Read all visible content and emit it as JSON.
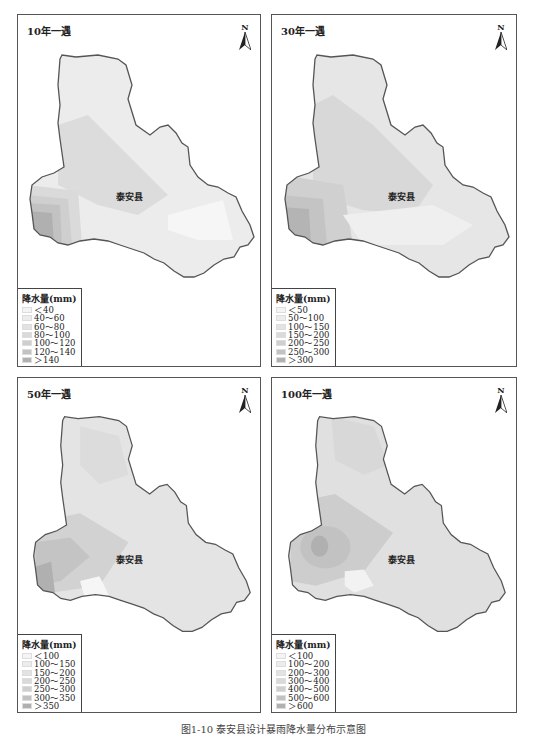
{
  "figure": {
    "caption": "图1-10 泰安县设计暴雨降水量分布示意图"
  },
  "shared": {
    "county_label": "泰安县",
    "north_label": "N",
    "legend_title": "降水量(mm)"
  },
  "panels": [
    {
      "title": "10年一遇",
      "legend": [
        {
          "label": "＜40",
          "color": "#f4f4f4"
        },
        {
          "label": "40～60",
          "color": "#ececec"
        },
        {
          "label": "60～80",
          "color": "#e3e3e3"
        },
        {
          "label": "80～100",
          "color": "#dadada"
        },
        {
          "label": "100～120",
          "color": "#cfcfcf"
        },
        {
          "label": "120～140",
          "color": "#c2c2c2"
        },
        {
          "label": "＞140",
          "color": "#b0b0b0"
        }
      ]
    },
    {
      "title": "30年一遇",
      "legend": [
        {
          "label": "＜50",
          "color": "#f4f4f4"
        },
        {
          "label": "50～100",
          "color": "#ececec"
        },
        {
          "label": "100～150",
          "color": "#e3e3e3"
        },
        {
          "label": "150～200",
          "color": "#dadada"
        },
        {
          "label": "200～250",
          "color": "#cfcfcf"
        },
        {
          "label": "250～300",
          "color": "#c2c2c2"
        },
        {
          "label": "＞300",
          "color": "#b0b0b0"
        }
      ]
    },
    {
      "title": "50年一遇",
      "legend": [
        {
          "label": "＜100",
          "color": "#f4f4f4"
        },
        {
          "label": "100～150",
          "color": "#ececec"
        },
        {
          "label": "150～200",
          "color": "#e3e3e3"
        },
        {
          "label": "200～250",
          "color": "#dadada"
        },
        {
          "label": "250～300",
          "color": "#cfcfcf"
        },
        {
          "label": "300～350",
          "color": "#c2c2c2"
        },
        {
          "label": "＞350",
          "color": "#b0b0b0"
        }
      ]
    },
    {
      "title": "100年一遇",
      "legend": [
        {
          "label": "＜100",
          "color": "#f4f4f4"
        },
        {
          "label": "100～200",
          "color": "#ececec"
        },
        {
          "label": "200～300",
          "color": "#e3e3e3"
        },
        {
          "label": "300～400",
          "color": "#dadada"
        },
        {
          "label": "400～500",
          "color": "#cfcfcf"
        },
        {
          "label": "500～600",
          "color": "#c2c2c2"
        },
        {
          "label": "＞600",
          "color": "#b0b0b0"
        }
      ]
    }
  ]
}
